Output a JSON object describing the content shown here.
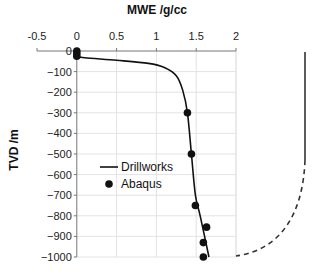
{
  "chart_data": {
    "type": "line",
    "title": "",
    "xlabel": "MWE /g/cc",
    "ylabel": "TVD /m",
    "xlim": [
      -0.5,
      2
    ],
    "ylim": [
      -1000,
      0
    ],
    "x_ticks": [
      "-0.5",
      "0",
      "0.5",
      "1",
      "1.5",
      "2"
    ],
    "y_ticks": [
      "0",
      "-100",
      "-200",
      "-300",
      "-400",
      "-500",
      "-600",
      "-700",
      "-800",
      "-900",
      "-1000"
    ],
    "grid": true,
    "x_axis_position": "top",
    "legend_position": "inside-left",
    "series": [
      {
        "name": "Drillworks",
        "style": "line",
        "color": "#111111",
        "x": [
          0,
          0.1,
          0.5,
          0.9,
          1.1,
          1.25,
          1.33,
          1.39,
          1.44,
          1.49,
          1.55,
          1.66
        ],
        "y": [
          -25,
          -33,
          -45,
          -60,
          -80,
          -120,
          -190,
          -300,
          -500,
          -700,
          -800,
          -1000
        ]
      },
      {
        "name": "Abaqus",
        "style": "scatter",
        "color": "#111111",
        "x": [
          0,
          0,
          0,
          1.39,
          1.44,
          1.49,
          1.63,
          1.59,
          1.59
        ],
        "y": [
          0,
          -12,
          -25,
          -300,
          -500,
          -750,
          -855,
          -930,
          -1000
        ]
      }
    ],
    "annotations": [
      {
        "type": "solid-vertical-line",
        "description": "well schematic vertical section at right"
      },
      {
        "type": "dashed-curve",
        "description": "build section curving toward plot bottom"
      }
    ]
  },
  "labels": {
    "x_title": "MWE /g/cc",
    "y_title": "TVD /m",
    "legend_line": "Drillworks",
    "legend_dot": "Abaqus"
  }
}
